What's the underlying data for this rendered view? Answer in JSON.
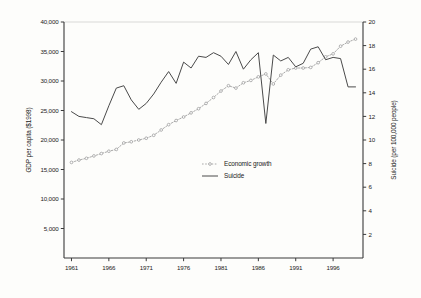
{
  "chart_data": {
    "type": "line",
    "title": "",
    "xlabel": "",
    "ylabel": "GDP per capita ($1998)",
    "y2label": "Suicide (per 100,000 people)",
    "grid": false,
    "legend_position": "center",
    "x": [
      1961,
      1962,
      1963,
      1964,
      1965,
      1966,
      1967,
      1968,
      1969,
      1970,
      1971,
      1972,
      1973,
      1974,
      1975,
      1976,
      1977,
      1978,
      1979,
      1980,
      1981,
      1982,
      1983,
      1984,
      1985,
      1986,
      1987,
      1988,
      1989,
      1990,
      1991,
      1992,
      1993,
      1994,
      1995,
      1996,
      1997,
      1998,
      1999
    ],
    "xlim": [
      1960,
      2000
    ],
    "xticks": [
      1961,
      1966,
      1971,
      1976,
      1981,
      1986,
      1991,
      1996
    ],
    "xticklabels": [
      "1961",
      "1966",
      "1971",
      "1976",
      "1981",
      "1986",
      "1991",
      "1996"
    ],
    "ylim": [
      0,
      40000
    ],
    "yticks": [
      5000,
      10000,
      15000,
      20000,
      25000,
      30000,
      35000,
      40000
    ],
    "yticklabels": [
      "5,000",
      "10,000",
      "15,000",
      "20,000",
      "25,000",
      "30,000",
      "35,000",
      "40,000"
    ],
    "y2lim": [
      0,
      20
    ],
    "y2ticks": [
      2,
      4,
      6,
      8,
      10,
      12,
      14,
      16,
      18,
      20
    ],
    "y2ticklabels": [
      "2",
      "4",
      "6",
      "8",
      "10",
      "12",
      "14",
      "16",
      "18",
      "20"
    ],
    "series": [
      {
        "name": "Economic growth",
        "axis": "left",
        "style": "dotted-markers",
        "color": "#9a9a9a",
        "marker": "circle",
        "values": [
          16200,
          16600,
          16900,
          17300,
          17700,
          18100,
          18400,
          19500,
          19700,
          20000,
          20300,
          20800,
          21700,
          22600,
          23300,
          23900,
          24600,
          25300,
          26200,
          27200,
          28300,
          29200,
          28800,
          29700,
          30100,
          30700,
          31200,
          29500,
          31000,
          31900,
          32200,
          32200,
          32300,
          33100,
          34100,
          34600,
          35900,
          36600,
          37100
        ]
      },
      {
        "name": "Suicide",
        "axis": "right",
        "style": "solid",
        "color": "#4a4a4a",
        "values": [
          12.4,
          12.0,
          11.9,
          11.8,
          11.3,
          12.9,
          14.4,
          14.6,
          13.4,
          12.6,
          13.1,
          13.9,
          14.9,
          15.8,
          14.8,
          16.6,
          16.1,
          17.1,
          17.0,
          17.4,
          17.1,
          16.4,
          17.5,
          16.0,
          16.8,
          17.4,
          11.4,
          17.2,
          16.7,
          17.0,
          16.2,
          16.5,
          17.7,
          17.9,
          16.8,
          17.0,
          16.9,
          14.5,
          14.5
        ]
      }
    ]
  },
  "legend": {
    "entries": [
      {
        "label": "Economic growth",
        "style": "dotted-markers"
      },
      {
        "label": "Suicide",
        "style": "solid"
      }
    ]
  }
}
